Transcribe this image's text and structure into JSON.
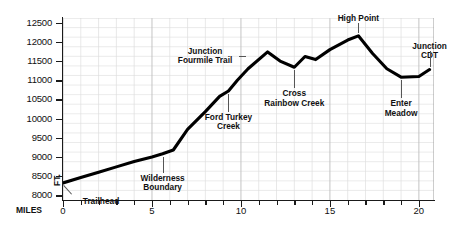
{
  "chart_data": {
    "type": "line",
    "title": "",
    "xlabel": "MILES",
    "ylabel": "FT.",
    "xlim": [
      0,
      20.85
    ],
    "ylim": [
      7875,
      12625
    ],
    "grid": true,
    "legend": null,
    "y_ticks": [
      8000,
      8500,
      9000,
      9500,
      10000,
      10500,
      11000,
      11500,
      12000,
      12500
    ],
    "y_tick_labels": [
      "8000",
      "8500",
      "9000",
      "9500",
      "10000",
      "10500",
      "11000",
      "11500",
      "12000",
      "12500"
    ],
    "y_minor_step": 250,
    "x_ticks": [
      0,
      1,
      2,
      3,
      4,
      5,
      6,
      7,
      8,
      9,
      10,
      11,
      12,
      13,
      14,
      15,
      16,
      17,
      18,
      19,
      20
    ],
    "x_tick_labels_shown": [
      "0",
      "5",
      "10",
      "15",
      "20"
    ],
    "x_labeled_ticks": [
      0,
      5,
      10,
      15,
      20
    ],
    "series": [
      {
        "name": "Trail elevation profile",
        "x": [
          0,
          1,
          2,
          3,
          4,
          5,
          5.6,
          6.2,
          7,
          8,
          8.8,
          9.3,
          9.8,
          10.4,
          11.5,
          12.2,
          13.0,
          13.6,
          14.2,
          15.0,
          16.0,
          16.6,
          17.4,
          18.2,
          19.0,
          20.0,
          20.6
        ],
        "y": [
          8320,
          8460,
          8600,
          8740,
          8880,
          9000,
          9080,
          9180,
          9720,
          10180,
          10580,
          10720,
          11000,
          11300,
          11740,
          11500,
          11340,
          11620,
          11540,
          11800,
          12050,
          12160,
          11700,
          11300,
          11080,
          11100,
          11280
        ]
      }
    ],
    "annotations": [
      {
        "text": "Trailhead",
        "x": 0.0,
        "y": 8320,
        "note": "label below-right of start with diagonal leader"
      },
      {
        "text": "Wilderness\nBoundary",
        "x": 5.6,
        "y": 9080,
        "note": "label below with vertical leader"
      },
      {
        "text": "Ford Turkey\nCreek",
        "x": 9.3,
        "y": 10720,
        "note": "label below with vertical leader"
      },
      {
        "text": "Junction\nFourmile Trail",
        "x": 10.4,
        "y": 11300,
        "note": "label left with horizontal leader"
      },
      {
        "text": "Cross\nRainbow Creek",
        "x": 13.0,
        "y": 11340,
        "note": "label below with vertical leader"
      },
      {
        "text": "High Point",
        "x": 16.6,
        "y": 12160,
        "note": "label above with vertical leader"
      },
      {
        "text": "Enter\nMeadow",
        "x": 19.0,
        "y": 11080,
        "note": "label below with vertical leader"
      },
      {
        "text": "Junction\nCDT",
        "x": 20.6,
        "y": 11280,
        "note": "label above with vertical leader"
      }
    ],
    "line_color": "#000000",
    "grid_color": "#d8d8d8",
    "axis_color": "#1a1a1a",
    "background": "#ffffff"
  }
}
